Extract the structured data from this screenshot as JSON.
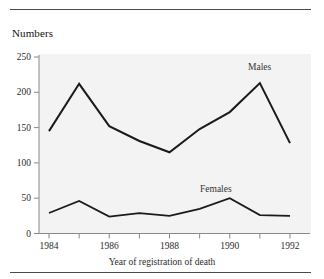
{
  "figure": {
    "y_axis_title": "Numbers",
    "x_axis_title": "Year of registration of death",
    "series_labels": {
      "males": "Males",
      "females": "Females"
    },
    "rules": {
      "top": "horizontal-rule",
      "bottom": "horizontal-rule"
    }
  },
  "chart_data": {
    "type": "line",
    "title": "",
    "subtitle": "",
    "xlabel": "Year of registration of death",
    "ylabel": "Numbers",
    "xlim": [
      1984,
      1992
    ],
    "ylim": [
      0,
      250
    ],
    "grid": false,
    "legend": "inline-labels",
    "x": [
      1984,
      1985,
      1986,
      1987,
      1988,
      1989,
      1990,
      1991,
      1992
    ],
    "xtick_labels": [
      "1984",
      "",
      "1986",
      "",
      "1988",
      "",
      "1990",
      "",
      "1992"
    ],
    "xticks_major": [
      "1984",
      "1986",
      "1988",
      "1990",
      "1992"
    ],
    "yticks": [
      0,
      50,
      100,
      150,
      200,
      250
    ],
    "ytick_labels": [
      "0",
      "50",
      "100",
      "150",
      "200",
      "250"
    ],
    "series": [
      {
        "name": "Males",
        "color": "#1a1a1a",
        "values": [
          145,
          212,
          152,
          131,
          115,
          148,
          172,
          213,
          128
        ]
      },
      {
        "name": "Females",
        "color": "#1a1a1a",
        "values": [
          29,
          46,
          24,
          29,
          25,
          35,
          50,
          26,
          25
        ]
      }
    ]
  },
  "colors": {
    "line": "#1a1a1a",
    "axis": "#8a8a8a",
    "plot_background": "#f3f3f3",
    "text": "#222222",
    "rule": "#4a4a4a"
  }
}
